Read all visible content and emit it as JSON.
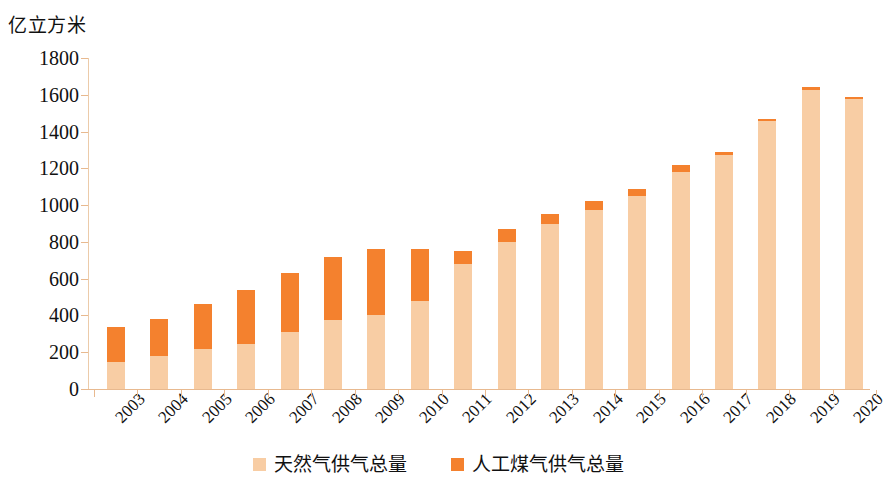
{
  "chart_data": {
    "type": "bar",
    "subtype": "stacked",
    "title": "",
    "unit_label": "亿立方米",
    "xlabel": "",
    "ylabel": "",
    "ylim": [
      0,
      1800
    ],
    "ytick_step": 200,
    "yticks": [
      0,
      200,
      400,
      600,
      800,
      1000,
      1200,
      1400,
      1600,
      1800
    ],
    "grid": false,
    "legend_position": "bottom-center",
    "categories": [
      "2003",
      "2004",
      "2005",
      "2006",
      "2007",
      "2008",
      "2009",
      "2010",
      "2011",
      "2012",
      "2013",
      "2014",
      "2015",
      "2016",
      "2017",
      "2018",
      "2019",
      "2020"
    ],
    "series": [
      {
        "name": "天然气供气总量",
        "color": "#f8cda4",
        "values": [
          145,
          180,
          215,
          245,
          310,
          375,
          400,
          480,
          680,
          800,
          900,
          975,
          1050,
          1180,
          1270,
          1455,
          1625,
          1575
        ]
      },
      {
        "name": "人工煤气供气总量",
        "color": "#f4812e",
        "values": [
          195,
          200,
          250,
          295,
          320,
          345,
          360,
          280,
          70,
          70,
          50,
          45,
          40,
          40,
          20,
          15,
          15,
          15
        ]
      }
    ],
    "totals": [
      340,
      380,
      465,
      540,
      630,
      720,
      760,
      760,
      750,
      870,
      950,
      1020,
      1090,
      1220,
      1290,
      1470,
      1640,
      1590
    ]
  },
  "legend": {
    "items": [
      {
        "label": "天然气供气总量",
        "color": "#f8cda4"
      },
      {
        "label": "人工煤气供气总量",
        "color": "#f4812e"
      }
    ]
  },
  "axis": {
    "y_unit": "亿立方米"
  },
  "colors": {
    "natural_gas": "#f8cda4",
    "manufactured_gas": "#f4812e",
    "axis": "#e8b98f",
    "background": "#ffffff",
    "text": "#111111"
  }
}
